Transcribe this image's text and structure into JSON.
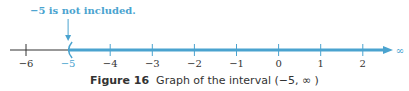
{
  "annotation": "−5 is not included.",
  "axis": {
    "ticks": [
      -6,
      -5,
      -4,
      -3,
      -2,
      -1,
      0,
      1,
      2
    ],
    "tick_labels": [
      "−6",
      "−5",
      "−4",
      "−3",
      "−2",
      "−1",
      "0",
      "1",
      "2"
    ],
    "highlight_tick": -5,
    "infinity_label": "∞"
  },
  "interval": {
    "left": -5,
    "right": "infinity",
    "left_open": true,
    "notation": "(−5, ∞)"
  },
  "colors": {
    "highlight": "#4aa3cf",
    "axis": "#333333"
  },
  "caption": {
    "figure": "Figure 16",
    "text": "Graph of the interval (−5, ∞ )"
  }
}
